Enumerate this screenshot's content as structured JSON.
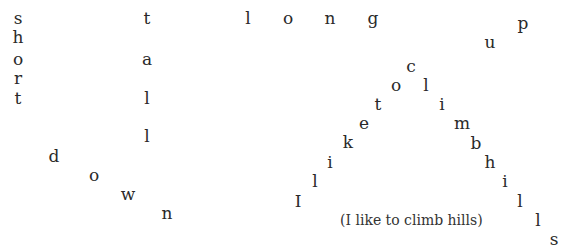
{
  "words": {
    "short": [
      {
        "c": "s",
        "x": 18,
        "y": 18
      },
      {
        "c": "h",
        "x": 18,
        "y": 37
      },
      {
        "c": "o",
        "x": 18,
        "y": 59
      },
      {
        "c": "r",
        "x": 18,
        "y": 78
      },
      {
        "c": "t",
        "x": 18,
        "y": 98
      }
    ],
    "tall": [
      {
        "c": "t",
        "x": 147,
        "y": 18
      },
      {
        "c": "a",
        "x": 147,
        "y": 59
      },
      {
        "c": "l",
        "x": 147,
        "y": 98
      },
      {
        "c": "l",
        "x": 147,
        "y": 136
      }
    ],
    "down": [
      {
        "c": "d",
        "x": 54,
        "y": 156
      },
      {
        "c": "o",
        "x": 94,
        "y": 175
      },
      {
        "c": "w",
        "x": 128,
        "y": 194
      },
      {
        "c": "n",
        "x": 167,
        "y": 213
      }
    ],
    "long": [
      {
        "c": "l",
        "x": 248,
        "y": 18
      },
      {
        "c": "o",
        "x": 288,
        "y": 18
      },
      {
        "c": "n",
        "x": 330,
        "y": 18
      },
      {
        "c": "g",
        "x": 373,
        "y": 18
      }
    ],
    "up": [
      {
        "c": "u",
        "x": 490,
        "y": 42
      },
      {
        "c": "p",
        "x": 523,
        "y": 23
      }
    ],
    "climb": [
      {
        "c": "I",
        "x": 298,
        "y": 201
      },
      {
        "c": "l",
        "x": 315,
        "y": 181
      },
      {
        "c": "i",
        "x": 330,
        "y": 162
      },
      {
        "c": "k",
        "x": 348,
        "y": 142
      },
      {
        "c": "e",
        "x": 364,
        "y": 123
      },
      {
        "c": "t",
        "x": 378,
        "y": 104
      },
      {
        "c": "o",
        "x": 396,
        "y": 85
      },
      {
        "c": "c",
        "x": 411,
        "y": 66
      },
      {
        "c": "l",
        "x": 426,
        "y": 85
      },
      {
        "c": "i",
        "x": 442,
        "y": 104
      },
      {
        "c": "m",
        "x": 462,
        "y": 123
      },
      {
        "c": "b",
        "x": 476,
        "y": 143
      },
      {
        "c": "h",
        "x": 490,
        "y": 162
      },
      {
        "c": "i",
        "x": 505,
        "y": 181
      },
      {
        "c": "l",
        "x": 520,
        "y": 201
      },
      {
        "c": "l",
        "x": 538,
        "y": 220
      },
      {
        "c": "s",
        "x": 554,
        "y": 239
      }
    ]
  },
  "caption": {
    "text": "(I like to climb hills)",
    "x": 340,
    "y": 220
  }
}
